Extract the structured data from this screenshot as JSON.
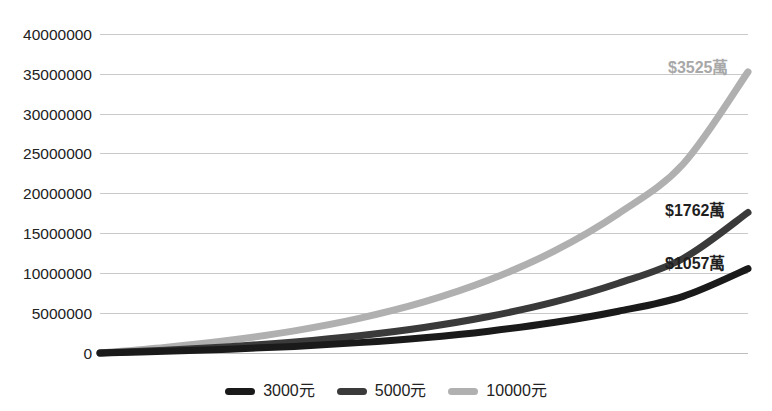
{
  "chart_data": {
    "type": "line",
    "title": "",
    "xlabel": "",
    "ylabel": "",
    "ylim": [
      0,
      40000000
    ],
    "y_ticks": [
      "0",
      "5000000",
      "10000000",
      "15000000",
      "20000000",
      "25000000",
      "30000000",
      "35000000",
      "40000000"
    ],
    "grid": true,
    "legend_position": "bottom",
    "x": [
      0,
      5,
      10,
      15,
      20,
      25,
      30,
      35,
      40,
      45,
      50
    ],
    "series": [
      {
        "name": "3000元",
        "color": "#1a1a1a",
        "end_label": "$1057萬",
        "end_value": 10570000,
        "values": [
          0,
          210000,
          480000,
          830000,
          1300000,
          1920000,
          2740000,
          3820000,
          5240000,
          7110000,
          10570000
        ]
      },
      {
        "name": "5000元",
        "color": "#3a3a3a",
        "end_label": "$1762萬",
        "end_value": 17620000,
        "values": [
          0,
          350000,
          800000,
          1390000,
          2170000,
          3200000,
          4570000,
          6370000,
          8740000,
          11850000,
          17620000
        ]
      },
      {
        "name": "10000元",
        "color": "#b0b0b0",
        "end_label": "$3525萬",
        "end_value": 35250000,
        "values": [
          0,
          700000,
          1600000,
          2780000,
          4340000,
          6400000,
          9140000,
          12740000,
          17480000,
          23700000,
          35250000
        ]
      }
    ]
  },
  "legend": {
    "items": [
      {
        "label": "3000元",
        "color": "#1a1a1a"
      },
      {
        "label": "5000元",
        "color": "#3a3a3a"
      },
      {
        "label": "10000元",
        "color": "#b0b0b0"
      }
    ]
  },
  "y_axis": {
    "labels": [
      "40000000",
      "35000000",
      "30000000",
      "25000000",
      "20000000",
      "15000000",
      "10000000",
      "5000000",
      "0"
    ]
  },
  "point_labels": [
    {
      "text": "$3525萬",
      "color": "#a8a8a8"
    },
    {
      "text": "$1762萬",
      "color": "#1f1f1f"
    },
    {
      "text": "$1057萬",
      "color": "#1f1f1f"
    }
  ]
}
